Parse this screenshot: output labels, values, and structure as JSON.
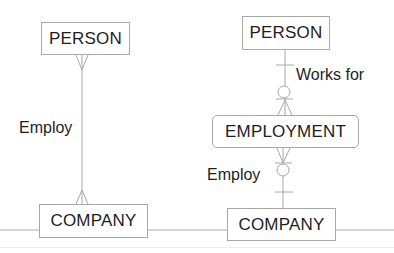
{
  "left_diagram": {
    "top_entity": "PERSON",
    "bottom_entity": "COMPANY",
    "relationship_label": "Employ",
    "notation": "many-to-many"
  },
  "right_diagram": {
    "top_entity": "PERSON",
    "middle_entity": "EMPLOYMENT",
    "bottom_entity": "COMPANY",
    "upper_relationship_label": "Works for",
    "lower_relationship_label": "Employ",
    "notation": "one-to-many via associative entity"
  },
  "colors": {
    "line": "#a8a8a8",
    "text": "#1e1e1e"
  }
}
